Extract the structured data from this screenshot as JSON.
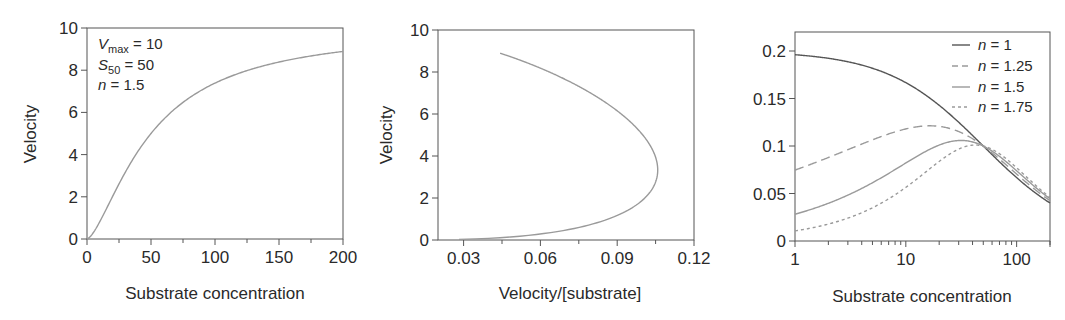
{
  "figure": {
    "panels": [
      {
        "id": "velocity-vs-substrate",
        "xlabel": "Substrate concentration",
        "ylabel": "Velocity",
        "xticks": [
          "0",
          "50",
          "100",
          "150",
          "200"
        ],
        "yticks": [
          "0",
          "2",
          "4",
          "6",
          "8",
          "10"
        ],
        "annotation": {
          "line1_var": "V",
          "line1_sub": "max",
          "line1_rest": " = 10",
          "line2_var": "S",
          "line2_sub": "50",
          "line2_rest": " = 50",
          "line3_var": "n",
          "line3_rest": " = 1.5"
        }
      },
      {
        "id": "eadie-hofstee",
        "xlabel": "Velocity/[substrate]",
        "ylabel": "Velocity",
        "xticks": [
          "0.03",
          "0.06",
          "0.09",
          "0.12"
        ],
        "yticks": [
          "0",
          "2",
          "4",
          "6",
          "8",
          "10"
        ]
      },
      {
        "id": "v-over-s-log",
        "xlabel": "Substrate concentration",
        "ylabel": "",
        "xticks": [
          "1",
          "10",
          "100"
        ],
        "yticks": [
          "0",
          "0.05",
          "0.1",
          "0.15",
          "0.2"
        ],
        "legend": [
          {
            "var": "n",
            "rest": " = 1"
          },
          {
            "var": "n",
            "rest": " = 1.25"
          },
          {
            "var": "n",
            "rest": " = 1.5"
          },
          {
            "var": "n",
            "rest": " = 1.75"
          }
        ]
      }
    ],
    "colors": {
      "axis": "#555555",
      "curve_light": "#9a9a9a",
      "curve_dark": "#555555"
    }
  },
  "chart_data": [
    {
      "type": "line",
      "title": "",
      "xlabel": "Substrate concentration",
      "ylabel": "Velocity",
      "xlim": [
        0,
        200
      ],
      "ylim": [
        0,
        10
      ],
      "grid": false,
      "annotation": "Vmax = 10, S50 = 50, n = 1.5",
      "model": {
        "Vmax": 10,
        "S50": 50,
        "n": 1.5
      },
      "x": [
        0,
        10,
        25,
        50,
        75,
        100,
        125,
        150,
        175,
        200
      ],
      "series": [
        {
          "name": "n = 1.5",
          "values": [
            0,
            0.82,
            2.61,
            5.0,
            6.48,
            7.39,
            7.98,
            8.39,
            8.68,
            8.89
          ]
        }
      ]
    },
    {
      "type": "line",
      "title": "",
      "xlabel": "Velocity/[substrate]",
      "ylabel": "Velocity",
      "xlim": [
        0.02,
        0.12
      ],
      "ylim": [
        0,
        10
      ],
      "grid": false,
      "series": [
        {
          "name": "n = 1.5",
          "x": [
            0.029,
            0.082,
            0.1,
            0.104,
            0.1,
            0.086,
            0.074,
            0.056,
            0.044
          ],
          "values": [
            0.03,
            0.82,
            1.74,
            2.61,
            5.0,
            6.48,
            7.39,
            8.39,
            8.89
          ]
        }
      ]
    },
    {
      "type": "line",
      "title": "",
      "xlabel": "Substrate concentration",
      "ylabel": "",
      "xscale": "log",
      "xlim": [
        1,
        200
      ],
      "ylim": [
        0,
        0.22
      ],
      "grid": false,
      "legend_position": "upper right",
      "x": [
        1,
        3,
        10,
        20,
        30,
        50,
        100,
        200
      ],
      "series": [
        {
          "name": "n = 1",
          "style": "solid-dark",
          "values": [
            0.196,
            0.189,
            0.167,
            0.143,
            0.125,
            0.1,
            0.067,
            0.04
          ]
        },
        {
          "name": "n = 1.25",
          "style": "dashed",
          "values": [
            0.075,
            0.098,
            0.118,
            0.12,
            0.115,
            0.1,
            0.07,
            0.043
          ]
        },
        {
          "name": "n = 1.5",
          "style": "solid-light",
          "values": [
            0.028,
            0.049,
            0.082,
            0.1,
            0.104,
            0.1,
            0.074,
            0.044
          ]
        },
        {
          "name": "n = 1.75",
          "style": "dotted",
          "values": [
            0.011,
            0.023,
            0.054,
            0.08,
            0.094,
            0.1,
            0.077,
            0.046
          ]
        }
      ]
    }
  ]
}
